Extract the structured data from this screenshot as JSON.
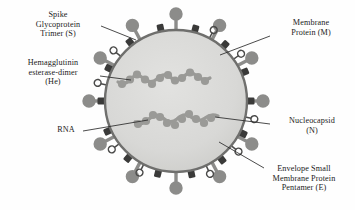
{
  "figure": {
    "colors": {
      "background": "#fefefe",
      "envelope_fill": "#d6d6d4",
      "envelope_stroke": "#6f6f6d",
      "spike_protein": "#8c8c8a",
      "membrane_protein": "#3a3a39",
      "he_dimer_stroke": "#4a4a49",
      "nucleocapsid": "#9a9a97",
      "leader_line": "#2a2a2a",
      "text": "#1b1b1b"
    },
    "geometry": {
      "center_x": 176,
      "center_y": 101,
      "radius": 71
    }
  },
  "labels": {
    "spike": {
      "name": "Spike Glycoprotein Trimer (S)",
      "lines": [
        "Spike",
        "Glycoprotein",
        "Trimer (S)"
      ]
    },
    "hemagglutinin": {
      "name": "Hemagglutinin esterase-dimer (He)",
      "lines": [
        "Hemagglutinin",
        "esterase-dimer",
        "(He)"
      ]
    },
    "rna": {
      "name": "RNA",
      "lines": [
        "RNA"
      ]
    },
    "membrane": {
      "name": "Membrane Protein (M)",
      "lines": [
        "Membrane",
        "Protein (M)"
      ]
    },
    "nucleocapsid": {
      "name": "Nucleocapsid (N)",
      "lines": [
        "Nucleocapsid",
        "(N)"
      ]
    },
    "envelope": {
      "name": "Envelope Small Membrane Protein Pentamer (E)",
      "lines": [
        "Envelope Small",
        "Membrane Protein",
        "Pentamer (E)"
      ]
    }
  },
  "structures": {
    "spike_count": 12,
    "membrane_protein_count": 14,
    "he_dimer_count": 8,
    "nucleocapsid_strands": 2
  }
}
